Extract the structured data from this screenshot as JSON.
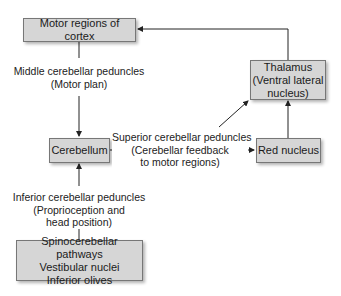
{
  "diagram": {
    "nodes": {
      "motor": {
        "label": "Motor regions of cortex"
      },
      "cerebellum": {
        "label": "Cerebellum"
      },
      "thalamus": {
        "line1": "Thalamus",
        "line2": "(Ventral lateral",
        "line3": "nucleus)"
      },
      "red_nucleus": {
        "label": "Red nucleus"
      },
      "inputs": {
        "line1": "Spinocerebellar pathways",
        "line2": "Vestibular nuclei",
        "line3": "Inferior olives"
      }
    },
    "edges": {
      "middle": {
        "line1": "Middle cerebellar peduncles",
        "line2": "(Motor plan)"
      },
      "superior": {
        "line1": "Superior cerebellar peduncles",
        "line2": "(Cerebellar feedback",
        "line3": "to motor regions)"
      },
      "inferior": {
        "line1": "Inferior cerebellar peduncles",
        "line2": "(Proprioception and",
        "line3": "head position)"
      }
    },
    "colors": {
      "box_fill": "#d6d6d6",
      "box_border": "#777777",
      "line": "#222222"
    }
  }
}
